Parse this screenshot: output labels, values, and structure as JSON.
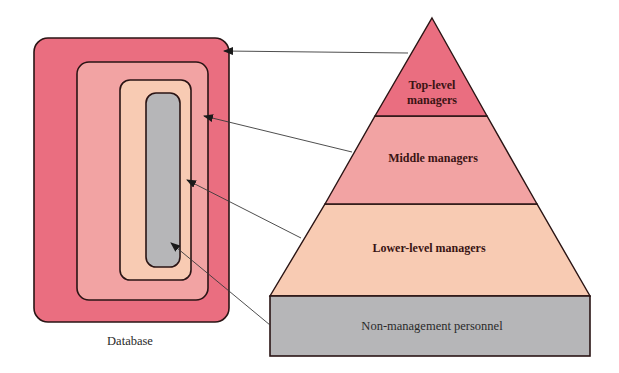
{
  "colors": {
    "top": "#ea6e80",
    "middle": "#f2a3a3",
    "lower": "#f8cbb3",
    "base": "#b6b6b8",
    "outline": "#2a1414",
    "arrow": "#3a3a3a"
  },
  "database": {
    "label": "Database",
    "layers": [
      "Top-level managers",
      "Middle managers",
      "Lower-level managers",
      "Non-management personnel"
    ]
  },
  "pyramid": {
    "top_line1": "Top-level",
    "top_line2": "managers",
    "middle": "Middle managers",
    "lower": "Lower-level managers",
    "base": "Non-management personnel"
  }
}
